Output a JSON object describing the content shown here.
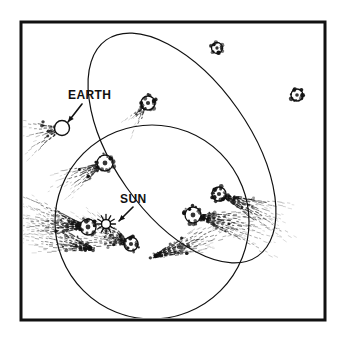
{
  "figure": {
    "type": "astronomy-orbital-diagram",
    "title_visible": false,
    "background_color": "#ffffff",
    "ink_color": "#111111",
    "frame": {
      "name": "figure-border",
      "x": 21,
      "y": 22,
      "width": 304,
      "height": 298,
      "stroke_width": 3,
      "color": "#111111"
    }
  },
  "labels": [
    {
      "id": "earth-label",
      "text": "EARTH",
      "x": 68,
      "y": 99,
      "font_size": 12,
      "bold": true,
      "arrow": {
        "x1": 82,
        "y1": 104,
        "x2": 68,
        "y2": 122
      }
    },
    {
      "id": "sun-label",
      "text": "SUN",
      "x": 120,
      "y": 203,
      "font_size": 12,
      "bold": true,
      "arrow": {
        "x1": 133,
        "y1": 207,
        "x2": 119,
        "y2": 221
      }
    }
  ],
  "bodies": {
    "sun": {
      "name": "sun-symbol",
      "x": 106,
      "y": 224,
      "core_radius": 4.5,
      "ray_count": 12,
      "ray_length": 5,
      "color": "#111111"
    },
    "earth": {
      "name": "earth-circle",
      "x": 62,
      "y": 128,
      "radius": 7.5,
      "fill": "none",
      "stroke": "#111111"
    }
  },
  "orbits": [
    {
      "id": "earth-orbit",
      "name": "earth-orbit-circle",
      "shape": "circle",
      "cx": 152,
      "cy": 222,
      "r": 97,
      "stroke": "#111111",
      "stroke_width": 1.2
    },
    {
      "id": "comet-orbit",
      "name": "comet-orbit-ellipse",
      "shape": "ellipse",
      "cx": 182,
      "cy": 148,
      "rx": 68,
      "ry": 132,
      "rotation_deg": -35,
      "stroke": "#111111",
      "stroke_width": 1.2
    }
  ],
  "comets": [
    {
      "id": "comet-1",
      "name": "comet-far-top",
      "x": 217,
      "y": 48,
      "nucleus_r": 5.5,
      "tail_angle_deg": 225,
      "tail_length": 0,
      "tail_spread_deg": 0,
      "tail_density": 0
    },
    {
      "id": "comet-2",
      "name": "comet-far-right",
      "x": 297,
      "y": 95,
      "nucleus_r": 6,
      "tail_angle_deg": 210,
      "tail_length": 0,
      "tail_spread_deg": 0,
      "tail_density": 0
    },
    {
      "id": "comet-3",
      "name": "comet-inbound-upper",
      "x": 148,
      "y": 103,
      "nucleus_r": 7,
      "tail_angle_deg": 128,
      "tail_length": 34,
      "tail_spread_deg": 26,
      "tail_density": 40
    },
    {
      "id": "comet-4",
      "name": "comet-inbound-mid",
      "x": 105,
      "y": 163,
      "nucleus_r": 8,
      "tail_angle_deg": 152,
      "tail_length": 58,
      "tail_spread_deg": 34,
      "tail_density": 70
    },
    {
      "id": "comet-5",
      "name": "comet-perihelion-left",
      "x": 88,
      "y": 227,
      "nucleus_r": 8,
      "tail_angle_deg": 188,
      "tail_length": 82,
      "tail_spread_deg": 40,
      "tail_density": 130
    },
    {
      "id": "comet-6",
      "name": "comet-perihelion-lower",
      "x": 131,
      "y": 244,
      "nucleus_r": 7,
      "tail_angle_deg": 200,
      "tail_length": 70,
      "tail_spread_deg": 46,
      "tail_density": 110
    },
    {
      "id": "comet-7",
      "name": "comet-outbound-lower",
      "x": 193,
      "y": 215,
      "nucleus_r": 8,
      "tail_angle_deg": 12,
      "tail_length": 86,
      "tail_spread_deg": 30,
      "tail_density": 120
    },
    {
      "id": "comet-8",
      "name": "comet-outbound-upper",
      "x": 219,
      "y": 194,
      "nucleus_r": 7,
      "tail_angle_deg": 22,
      "tail_length": 80,
      "tail_spread_deg": 26,
      "tail_density": 100
    }
  ],
  "extra_tails": [
    {
      "id": "tail-a",
      "name": "dust-tail-lower-left",
      "x": 96,
      "y": 250,
      "angle_deg": 196,
      "length": 78,
      "spread_deg": 34,
      "density": 90
    },
    {
      "id": "tail-b",
      "name": "dust-tail-lower-center",
      "x": 150,
      "y": 258,
      "angle_deg": 340,
      "length": 90,
      "spread_deg": 24,
      "density": 95
    },
    {
      "id": "tail-c",
      "name": "dust-tail-earth-glow",
      "x": 62,
      "y": 128,
      "angle_deg": 163,
      "length": 44,
      "spread_deg": 52,
      "density": 55
    }
  ]
}
